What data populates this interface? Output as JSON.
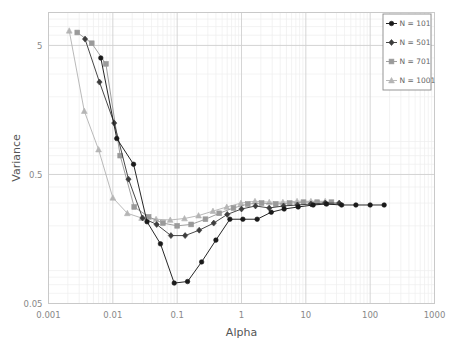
{
  "chart_data": {
    "type": "line",
    "title": "",
    "xlabel": "Alpha",
    "ylabel": "Variance",
    "xscale": "log",
    "yscale": "log",
    "xlim": [
      0.001,
      1000
    ],
    "ylim": [
      0.05,
      9
    ],
    "grid": true,
    "grid_minor": true,
    "legend_position": "top-right",
    "xticks": [
      "0.001",
      "0.01",
      "0.1",
      "1",
      "10",
      "100",
      "1000"
    ],
    "xtick_values": [
      0.001,
      0.01,
      0.1,
      1,
      10,
      100,
      1000
    ],
    "yticks": [
      "5",
      "0.5",
      "0.05"
    ],
    "ytick_values": [
      5,
      0.5,
      0.05
    ],
    "series": [
      {
        "name": "N = 101",
        "marker": "circle",
        "color": "#1a1a1a",
        "x": [
          0.0065,
          0.0115,
          0.021,
          0.034,
          0.055,
          0.09,
          0.145,
          0.24,
          0.4,
          0.66,
          1.05,
          1.75,
          2.9,
          4.6,
          7.6,
          13.0,
          21.0,
          36.0,
          60.0,
          100.0,
          165.0
        ],
        "y": [
          4.0,
          0.95,
          0.6,
          0.215,
          0.145,
          0.072,
          0.074,
          0.105,
          0.155,
          0.225,
          0.225,
          0.225,
          0.255,
          0.27,
          0.28,
          0.29,
          0.295,
          0.29,
          0.29,
          0.29,
          0.29
        ]
      },
      {
        "name": "N = 501",
        "marker": "diamond",
        "color": "#3d3d3d",
        "x": [
          0.0037,
          0.0062,
          0.0105,
          0.0175,
          0.029,
          0.048,
          0.08,
          0.133,
          0.22,
          0.37,
          0.6,
          1.0,
          1.65,
          2.7,
          4.5,
          7.4,
          12.0,
          20.0,
          33.0
        ],
        "y": [
          5.6,
          2.6,
          1.25,
          0.46,
          0.23,
          0.205,
          0.168,
          0.168,
          0.185,
          0.21,
          0.245,
          0.27,
          0.285,
          0.275,
          0.285,
          0.29,
          0.295,
          0.3,
          0.3
        ]
      },
      {
        "name": "N = 701",
        "marker": "square",
        "color": "#9a9a9a",
        "x": [
          0.0028,
          0.0047,
          0.0078,
          0.013,
          0.0215,
          0.036,
          0.06,
          0.1,
          0.165,
          0.275,
          0.45,
          0.75,
          1.25,
          2.05,
          3.4,
          5.6,
          9.2,
          15.0,
          25.0
        ],
        "y": [
          6.3,
          5.2,
          3.6,
          0.7,
          0.28,
          0.235,
          0.21,
          0.2,
          0.205,
          0.225,
          0.25,
          0.275,
          0.295,
          0.3,
          0.295,
          0.3,
          0.305,
          0.305,
          0.305
        ]
      },
      {
        "name": "N = 1001",
        "marker": "triangle",
        "color": "#b5b5b5",
        "x": [
          0.0021,
          0.0036,
          0.006,
          0.01,
          0.0168,
          0.028,
          0.047,
          0.078,
          0.13,
          0.215,
          0.36,
          0.59,
          0.98,
          1.62,
          2.7,
          4.4,
          7.3,
          12.0,
          20.0
        ],
        "y": [
          6.5,
          1.55,
          0.78,
          0.33,
          0.25,
          0.23,
          0.225,
          0.222,
          0.228,
          0.24,
          0.26,
          0.28,
          0.3,
          0.31,
          0.305,
          0.305,
          0.31,
          0.31,
          0.31
        ]
      }
    ]
  },
  "axes": {
    "xlabel": "Alpha",
    "ylabel": "Variance"
  },
  "legend": {
    "items": [
      {
        "label": "N = 101"
      },
      {
        "label": "N = 501"
      },
      {
        "label": "N = 701"
      },
      {
        "label": "N = 1001"
      }
    ]
  }
}
